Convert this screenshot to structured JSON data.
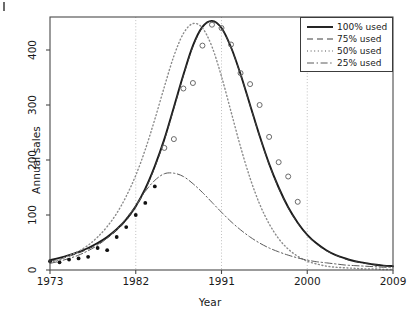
{
  "chart_data": {
    "type": "line",
    "title": "",
    "xlabel": "Year",
    "ylabel": "Annual sales",
    "xlim": [
      1973,
      2009
    ],
    "ylim": [
      0,
      460
    ],
    "xticks": [
      1973,
      1982,
      1991,
      2000,
      2009
    ],
    "xtick_labels": [
      "1973",
      "1982",
      "1991",
      "2000",
      "2009"
    ],
    "yticks": [
      0,
      100,
      200,
      300,
      400
    ],
    "ytick_labels": [
      "0",
      "100",
      "200",
      "300",
      "400"
    ],
    "grid": "vertical dotted gridlines at 1982, 1991, 2000",
    "legend_position": "top-right",
    "series": [
      {
        "name": "100% used",
        "style": "solid",
        "color": "#1a1a1a",
        "x": [
          1973,
          1974,
          1975,
          1976,
          1977,
          1978,
          1979,
          1980,
          1981,
          1982,
          1983,
          1984,
          1985,
          1986,
          1987,
          1988,
          1989,
          1990,
          1991,
          1992,
          1993,
          1994,
          1995,
          1996,
          1997,
          1998,
          1999,
          2000,
          2001,
          2002,
          2003,
          2004,
          2005,
          2006,
          2007,
          2008,
          2009
        ],
        "values": [
          18,
          22,
          27,
          33,
          40,
          49,
          60,
          74,
          92,
          116,
          148,
          189,
          238,
          296,
          355,
          408,
          442,
          453,
          440,
          405,
          356,
          300,
          244,
          193,
          150,
          114,
          86,
          64,
          48,
          36,
          27,
          21,
          16,
          13,
          10,
          8,
          7
        ]
      },
      {
        "name": "75% used",
        "style": "dashed",
        "color": "#3c3c3c",
        "x": [
          1973,
          1974,
          1975,
          1976,
          1977,
          1978,
          1979,
          1980,
          1981,
          1982,
          1983,
          1984,
          1985,
          1986,
          1987,
          1988,
          1989,
          1990,
          1991,
          1992,
          1993,
          1994,
          1995,
          1996,
          1997,
          1998,
          1999,
          2000,
          2001,
          2002,
          2003,
          2004,
          2005,
          2006,
          2007,
          2008,
          2009
        ],
        "values": [
          16,
          20,
          25,
          31,
          38,
          47,
          58,
          72,
          90,
          114,
          146,
          187,
          236,
          294,
          353,
          406,
          441,
          452,
          439,
          404,
          355,
          299,
          243,
          192,
          149,
          113,
          85,
          63,
          47,
          35,
          27,
          20,
          16,
          12,
          10,
          8,
          6
        ]
      },
      {
        "name": "50% used",
        "style": "dotted",
        "color": "#8a8a8a",
        "x": [
          1973,
          1974,
          1975,
          1976,
          1977,
          1978,
          1979,
          1980,
          1981,
          1982,
          1983,
          1984,
          1985,
          1986,
          1987,
          1988,
          1989,
          1990,
          1991,
          1992,
          1993,
          1994,
          1995,
          1996,
          1997,
          1998,
          1999,
          2000,
          2001,
          2002,
          2003,
          2004,
          2005,
          2006,
          2007,
          2008,
          2009
        ],
        "values": [
          14,
          19,
          26,
          34,
          45,
          60,
          79,
          103,
          134,
          172,
          219,
          274,
          333,
          389,
          430,
          448,
          440,
          406,
          352,
          288,
          224,
          167,
          120,
          84,
          57,
          38,
          25,
          16,
          11,
          7,
          5,
          4,
          3,
          2,
          2,
          1,
          1
        ]
      },
      {
        "name": "25% used",
        "style": "dashdot",
        "color": "#5a5a5a",
        "x": [
          1973,
          1974,
          1975,
          1976,
          1977,
          1978,
          1979,
          1980,
          1981,
          1982,
          1983,
          1984,
          1985,
          1986,
          1987,
          1988,
          1989,
          1990,
          1991,
          1992,
          1993,
          1994,
          1995,
          1996,
          1997,
          1998,
          1999,
          2000,
          2001,
          2002,
          2003,
          2004,
          2005,
          2006,
          2007,
          2008,
          2009
        ],
        "values": [
          12,
          16,
          21,
          27,
          35,
          45,
          58,
          74,
          94,
          117,
          143,
          163,
          175,
          176,
          170,
          157,
          141,
          123,
          105,
          88,
          73,
          60,
          49,
          40,
          33,
          27,
          22,
          18,
          15,
          13,
          11,
          9,
          8,
          7,
          6,
          5,
          5
        ]
      }
    ],
    "scatter": [
      {
        "name": "observed (filled)",
        "marker": "filled-circle",
        "color": "#111111",
        "points": [
          {
            "x": 1973,
            "y": 16
          },
          {
            "x": 1974,
            "y": 14
          },
          {
            "x": 1975,
            "y": 19
          },
          {
            "x": 1976,
            "y": 21
          },
          {
            "x": 1977,
            "y": 24
          },
          {
            "x": 1978,
            "y": 40
          },
          {
            "x": 1979,
            "y": 36
          },
          {
            "x": 1980,
            "y": 60
          },
          {
            "x": 1981,
            "y": 78
          },
          {
            "x": 1982,
            "y": 100
          },
          {
            "x": 1983,
            "y": 122
          },
          {
            "x": 1984,
            "y": 152
          }
        ]
      },
      {
        "name": "observed (open)",
        "marker": "open-circle",
        "color": "#6a6a6a",
        "points": [
          {
            "x": 1985,
            "y": 222
          },
          {
            "x": 1986,
            "y": 238
          },
          {
            "x": 1987,
            "y": 330
          },
          {
            "x": 1988,
            "y": 340
          },
          {
            "x": 1989,
            "y": 408
          },
          {
            "x": 1990,
            "y": 446
          },
          {
            "x": 1991,
            "y": 440
          },
          {
            "x": 1992,
            "y": 410
          },
          {
            "x": 1993,
            "y": 358
          },
          {
            "x": 1994,
            "y": 338
          },
          {
            "x": 1995,
            "y": 300
          },
          {
            "x": 1996,
            "y": 242
          },
          {
            "x": 1997,
            "y": 196
          },
          {
            "x": 1998,
            "y": 170
          },
          {
            "x": 1999,
            "y": 124
          }
        ]
      }
    ]
  },
  "legend": {
    "items": [
      {
        "label": "100% used",
        "key": "solid-line-key"
      },
      {
        "label": "75% used",
        "key": "dashed-line-key"
      },
      {
        "label": "50% used",
        "key": "dotted-line-key"
      },
      {
        "label": "25% used",
        "key": "dashdot-line-key"
      }
    ]
  }
}
